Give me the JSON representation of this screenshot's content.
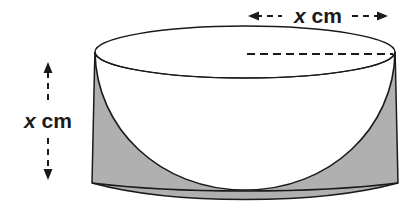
{
  "figure": {
    "shape_name": "cylinder-with-hemisphere",
    "background_color": "#ffffff",
    "outline_color": "#1a1a1a",
    "shade_color": "#b0b0b0",
    "body_fill": "#ffffff"
  },
  "labels": {
    "width": {
      "variable": "x",
      "unit": "cm",
      "full": "x cm",
      "orientation": "horizontal",
      "position": "top-right",
      "measures": "diameter"
    },
    "height": {
      "variable": "x",
      "unit": "cm",
      "full": "x cm",
      "orientation": "horizontal",
      "position": "left",
      "measures": "height"
    }
  },
  "annotations": {
    "top_arrow": {
      "name": "horizontal-dimension-arrow",
      "style": "dashed-double-headed",
      "x_start": 248,
      "x_end": 388,
      "y": 16
    },
    "left_arrow": {
      "name": "vertical-dimension-arrow",
      "style": "dashed-double-headed",
      "y_start": 62,
      "y_end": 180,
      "x": 48
    },
    "radius_line": {
      "name": "radius-dashed-line",
      "style": "dashed",
      "x_start": 247,
      "x_end": 393,
      "y": 54
    }
  },
  "geometry": {
    "top_ellipse": {
      "cx": 245,
      "cy": 52,
      "rx": 150,
      "ry": 26
    },
    "cylinder_top_left_x": 95,
    "cylinder_top_right_x": 395,
    "cylinder_bottom_left_x": 92,
    "cylinder_bottom_right_x": 398,
    "cylinder_bottom_y": 183,
    "hemisphere_bottom_y": 190,
    "base_arc_sag": 9
  },
  "shaded_regions": [
    {
      "name": "left-shaded-region",
      "side": "left"
    },
    {
      "name": "right-shaded-region",
      "side": "right"
    }
  ]
}
